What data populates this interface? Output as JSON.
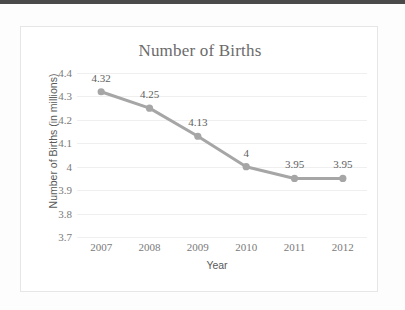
{
  "top_bar": {
    "color": "#4a4a4a"
  },
  "chart_data": {
    "type": "line",
    "title": "Number of Births",
    "xlabel": "Year",
    "ylabel": "Number of Births (in millions)",
    "categories": [
      "2007",
      "2008",
      "2009",
      "2010",
      "2011",
      "2012"
    ],
    "values": [
      4.32,
      4.25,
      4.13,
      4,
      3.95,
      3.95
    ],
    "data_labels": [
      "4.32",
      "4.25",
      "4.13",
      "4",
      "3.95",
      "3.95"
    ],
    "ylim": [
      3.7,
      4.4
    ],
    "yticks": [
      "4.4",
      "4.3",
      "4.2",
      "4.1",
      "4",
      "3.9",
      "3.8",
      "3.7"
    ],
    "ytick_values": [
      4.4,
      4.3,
      4.2,
      4.1,
      4,
      3.9,
      3.8,
      3.7
    ],
    "grid": true,
    "legend": false,
    "series_color": "#a6a6a6",
    "marker_color": "#a6a6a6",
    "gridline_color": "#efefef",
    "text_color": "#7a7a7a"
  }
}
